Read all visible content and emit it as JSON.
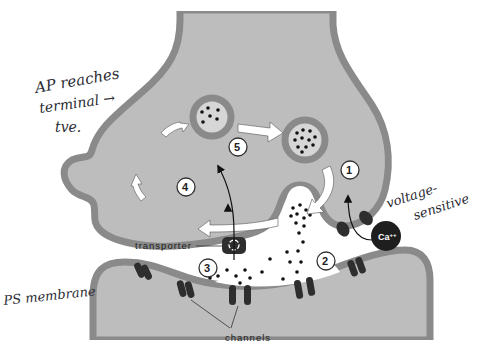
{
  "diagram": {
    "colors": {
      "cytoplasm": "#bdbdbd",
      "membrane": "#8a8a8a",
      "protein": "#2e2e2e",
      "background": "#ffffff",
      "arrow_fill": "#ffffff"
    },
    "labels": {
      "transporter": "transporter",
      "channels": "channels",
      "calcium": "Ca",
      "calcium_charge": "++"
    },
    "steps": [
      "1",
      "2",
      "3",
      "4",
      "5"
    ],
    "annotations": {
      "ap_line1": "AP reaches",
      "ap_line2": "terminal →",
      "ap_line3": "tve.",
      "voltage_line1": "voltage-",
      "voltage_line2": "sensitive",
      "ps_membrane": "PS membrane"
    },
    "nodes": [
      {
        "id": "presynaptic-terminal",
        "label": "Presynaptic terminal"
      },
      {
        "id": "postsynaptic-cell",
        "label": "Postsynaptic cell"
      },
      {
        "id": "vesicle-a",
        "label": "Recycled vesicle"
      },
      {
        "id": "vesicle-b",
        "label": "Filled vesicle"
      },
      {
        "id": "fusing-vesicle",
        "label": "Vesicle fusing with membrane"
      },
      {
        "id": "transporter",
        "label": "transporter"
      },
      {
        "id": "channels",
        "label": "channels"
      },
      {
        "id": "calcium-ion",
        "label": "Ca++"
      }
    ],
    "edges": [
      {
        "from": "vesicle-a",
        "to": "vesicle-b",
        "label": ""
      },
      {
        "from": "vesicle-b",
        "to": "fusing-vesicle",
        "label": "1"
      },
      {
        "from": "calcium-ion",
        "to": "presynaptic-terminal",
        "label": "1"
      },
      {
        "from": "fusing-vesicle",
        "to": "transporter",
        "label": "3"
      },
      {
        "from": "transporter",
        "to": "vesicle-a",
        "label": "5"
      }
    ]
  }
}
